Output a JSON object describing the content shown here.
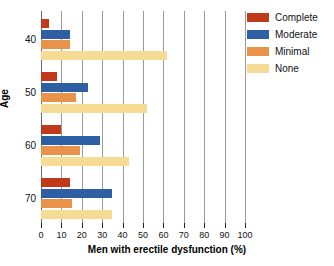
{
  "chart_data": {
    "type": "bar",
    "orientation": "horizontal",
    "title": "",
    "xlabel": "Men with erectile dysfunction (%)",
    "ylabel": "Age",
    "xlim": [
      0,
      100
    ],
    "xticks": [
      0,
      10,
      20,
      30,
      40,
      50,
      60,
      70,
      80,
      90,
      100
    ],
    "xtick_labels": [
      "0",
      "10",
      "20",
      "30",
      "40",
      "50",
      "60",
      "70",
      "80",
      "90",
      "100"
    ],
    "categories": [
      "40",
      "50",
      "60",
      "70"
    ],
    "grid": "vertical",
    "legend_position": "top-right",
    "series": [
      {
        "name": "Complete",
        "color": "#c0391b",
        "values": [
          4,
          8,
          10,
          14
        ]
      },
      {
        "name": "Moderate",
        "color": "#2e5fa3",
        "values": [
          14,
          23,
          29,
          35
        ]
      },
      {
        "name": "Minimal",
        "color": "#e8924a",
        "values": [
          14,
          17,
          19,
          15
        ]
      },
      {
        "name": "None",
        "color": "#f5db94",
        "values": [
          62,
          52,
          43,
          35
        ]
      }
    ]
  },
  "legend": {
    "items": [
      {
        "label": "Complete",
        "color": "#c0391b"
      },
      {
        "label": "Moderate",
        "color": "#2e5fa3"
      },
      {
        "label": "Minimal",
        "color": "#e8924a"
      },
      {
        "label": "None",
        "color": "#f5db94"
      }
    ]
  },
  "axes": {
    "x_title": "Men with erectile dysfunction (%)",
    "y_title": "Age"
  }
}
